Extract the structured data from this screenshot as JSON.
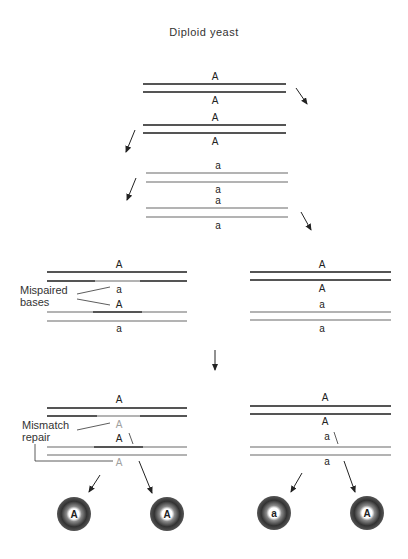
{
  "title": "Diploid yeast",
  "stages": {
    "initial": {
      "labels": [
        "A",
        "A"
      ]
    },
    "replicated_A": {
      "labels": [
        "A",
        "A"
      ]
    },
    "replicated_a1": {
      "labels": [
        "a",
        "a"
      ]
    },
    "replicated_a2": {
      "labels": [
        "a",
        "a"
      ]
    },
    "heteroduplex_left": {
      "labels": [
        "A",
        "a",
        "A",
        "a"
      ]
    },
    "homoduplex_right": {
      "labels": [
        "A",
        "A",
        "a",
        "a"
      ]
    },
    "repair_left": {
      "labels": [
        "A",
        "A",
        "A",
        "A"
      ]
    },
    "repair_right": {
      "labels": [
        "A",
        "A",
        "a",
        "a"
      ]
    }
  },
  "annotations": {
    "mispaired": "Mispaired",
    "bases": "bases",
    "mismatch": "Mismatch",
    "repair": "repair"
  },
  "spores": [
    "A",
    "A",
    "a",
    "A"
  ],
  "colors": {
    "strand_A": "#1c1c1c",
    "strand_a": "#9a9a9a",
    "repaired_label": "#a0a0a0"
  }
}
